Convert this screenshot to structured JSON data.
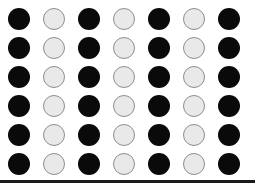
{
  "figure": {
    "title": "Alternating black and light grey circle grid",
    "caption": "",
    "background_color": "#ffffff",
    "width": 255,
    "height": 187
  },
  "grid": {
    "columns": 7,
    "rows": 6,
    "circle_diameter": 22,
    "column_pitch": 35,
    "row_pitch": 29,
    "origin_x": 8,
    "origin_y": 8,
    "column_labels": [
      "1",
      "2",
      "3",
      "4",
      "5",
      "6",
      "7"
    ],
    "row_labels": [
      "1",
      "2",
      "3",
      "4",
      "5",
      "6"
    ],
    "pattern_description": "Odd columns filled black, even columns filled light grey with grey outline",
    "cells": [
      [
        "dark",
        "light",
        "dark",
        "light",
        "dark",
        "light",
        "dark"
      ],
      [
        "dark",
        "light",
        "dark",
        "light",
        "dark",
        "light",
        "dark"
      ],
      [
        "dark",
        "light",
        "dark",
        "light",
        "dark",
        "light",
        "dark"
      ],
      [
        "dark",
        "light",
        "dark",
        "light",
        "dark",
        "light",
        "dark"
      ],
      [
        "dark",
        "light",
        "dark",
        "light",
        "dark",
        "light",
        "dark"
      ],
      [
        "dark",
        "light",
        "dark",
        "light",
        "dark",
        "light",
        "dark"
      ]
    ]
  },
  "colors": {
    "dark_fill": "#0a0a0a",
    "light_fill": "#e9e9e9",
    "light_stroke": "#8e8e8e",
    "rule_color": "#1a1a1a",
    "background": "#ffffff"
  },
  "baseline_rule": {
    "y": 180,
    "thickness": 3,
    "color": "#1a1a1a"
  }
}
